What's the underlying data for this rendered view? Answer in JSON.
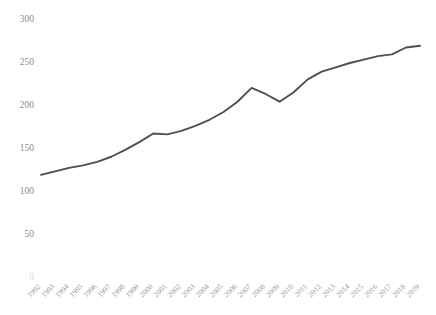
{
  "chart_data": {
    "type": "line",
    "title": "",
    "subtitle": "",
    "xlabel": "",
    "ylabel": "",
    "grid": false,
    "legend": false,
    "legend_position": "none",
    "line_color": "#4f4f4f",
    "background_color": "#ffffff",
    "axis_label_color": "#8c8c8c",
    "ylim": [
      0,
      300
    ],
    "yticks": [
      0,
      50,
      100,
      150,
      200,
      250,
      300
    ],
    "ytick_labels": [
      "0",
      "50",
      "100",
      "150",
      "200",
      "250",
      "300"
    ],
    "x": [
      1992,
      1993,
      1994,
      1995,
      1996,
      1997,
      1998,
      1999,
      2000,
      2001,
      2002,
      2003,
      2004,
      2005,
      2006,
      2007,
      2008,
      2009,
      2010,
      2011,
      2012,
      2013,
      2014,
      2015,
      2016,
      2017,
      2018,
      2019
    ],
    "categories": [
      "1992",
      "1993",
      "1994",
      "1995",
      "1996",
      "1997",
      "1998",
      "1999",
      "2000",
      "2001",
      "2002",
      "2003",
      "2004",
      "2005",
      "2006",
      "2007",
      "2008",
      "2009",
      "2010",
      "2011",
      "2012",
      "2013",
      "2014",
      "2015",
      "2016",
      "2017",
      "2018",
      "2019"
    ],
    "values": [
      120,
      124,
      128,
      131,
      135,
      141,
      149,
      158,
      168,
      167,
      171,
      177,
      184,
      193,
      205,
      221,
      214,
      205,
      216,
      231,
      240,
      245,
      250,
      254,
      258,
      260,
      268,
      270
    ],
    "series": [
      {
        "name": "",
        "values": [
          120,
          124,
          128,
          131,
          135,
          141,
          149,
          158,
          168,
          167,
          171,
          177,
          184,
          193,
          205,
          221,
          214,
          205,
          216,
          231,
          240,
          245,
          250,
          254,
          258,
          260,
          268,
          270
        ]
      }
    ]
  }
}
